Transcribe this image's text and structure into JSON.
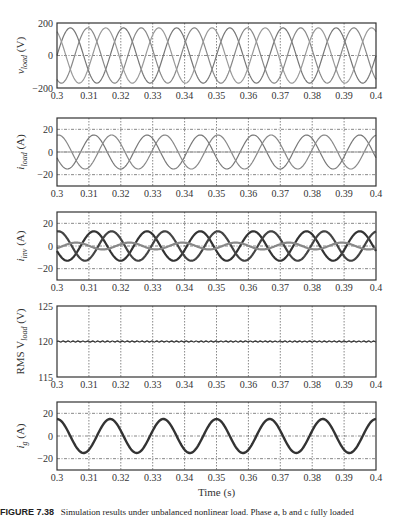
{
  "figure": {
    "xlabel": "Time (s)",
    "caption_label": "FIGURE 7.38",
    "caption_text": "Simulation results under unbalanced nonlinear load. Phase a, b and c fully loaded"
  },
  "chart_data": [
    {
      "type": "line",
      "ylabel": "v_load (V)",
      "ylabel_main": "v",
      "ylabel_sub": "load",
      "ylabel_unit": " (V)",
      "x_range": [
        0.3,
        0.4
      ],
      "ylim": [
        -200,
        200
      ],
      "yticks": [
        -200,
        0,
        200
      ],
      "xticks": [
        "0.3",
        "0.31",
        "0.32",
        "0.33",
        "0.34",
        "0.35",
        "0.36",
        "0.37",
        "0.38",
        "0.39",
        "0.4"
      ],
      "grid": true,
      "series": [
        {
          "name": "phase a",
          "amplitude": 170,
          "freq_hz": 60,
          "phase_deg": 0
        },
        {
          "name": "phase b",
          "amplitude": 170,
          "freq_hz": 60,
          "phase_deg": -120
        },
        {
          "name": "phase c",
          "amplitude": 170,
          "freq_hz": 60,
          "phase_deg": 120
        }
      ]
    },
    {
      "type": "line",
      "ylabel": "i_load (A)",
      "ylabel_main": "i",
      "ylabel_sub": "load",
      "ylabel_unit": " (A)",
      "x_range": [
        0.3,
        0.4
      ],
      "ylim": [
        -30,
        30
      ],
      "yticks": [
        -20,
        0,
        20
      ],
      "xticks": [
        "0.3",
        "0.31",
        "0.32",
        "0.33",
        "0.34",
        "0.35",
        "0.36",
        "0.37",
        "0.38",
        "0.39",
        "0.4"
      ],
      "grid": true,
      "series": [
        {
          "name": "phase a",
          "amplitude": 15,
          "freq_hz": 60,
          "phase_deg": 200
        },
        {
          "name": "phase b",
          "amplitude": 15,
          "freq_hz": 60,
          "phase_deg": 80
        },
        {
          "name": "phase c",
          "amplitude": 0,
          "freq_hz": 60,
          "phase_deg": 0
        }
      ]
    },
    {
      "type": "line",
      "ylabel": "i_inv (A)",
      "ylabel_main": "i",
      "ylabel_sub": "inv",
      "ylabel_unit": " (A)",
      "x_range": [
        0.3,
        0.4
      ],
      "ylim": [
        -30,
        30
      ],
      "yticks": [
        -20,
        0,
        20
      ],
      "xticks": [
        "0.3",
        "0.31",
        "0.32",
        "0.33",
        "0.34",
        "0.35",
        "0.36",
        "0.37",
        "0.38",
        "0.39",
        "0.4"
      ],
      "grid": true,
      "series": [
        {
          "name": "phase a",
          "amplitude": 13,
          "freq_hz": 60,
          "phase_deg": 200
        },
        {
          "name": "phase b",
          "amplitude": 13,
          "freq_hz": 60,
          "phase_deg": 80
        },
        {
          "name": "phase c",
          "amplitude": 3,
          "freq_hz": 60,
          "phase_deg": 320
        }
      ]
    },
    {
      "type": "line",
      "ylabel": "RMS V_load (V)",
      "ylabel_main": "RMS V",
      "ylabel_sub": "load",
      "ylabel_unit": " (V)",
      "x_range": [
        0.3,
        0.4
      ],
      "ylim": [
        115,
        125
      ],
      "yticks": [
        115,
        120,
        125
      ],
      "xticks": [
        "0.3",
        "0.31",
        "0.32",
        "0.33",
        "0.34",
        "0.35",
        "0.36",
        "0.37",
        "0.38",
        "0.39",
        "0.4"
      ],
      "grid": true,
      "series": [
        {
          "name": "RMS",
          "constant": 120
        }
      ]
    },
    {
      "type": "line",
      "ylabel": "i_g (A)",
      "ylabel_main": "i",
      "ylabel_sub": "g",
      "ylabel_unit": " (A)",
      "x_range": [
        0.3,
        0.4
      ],
      "ylim": [
        -30,
        30
      ],
      "yticks": [
        -20,
        0,
        20
      ],
      "xticks": [
        "0.3",
        "0.31",
        "0.32",
        "0.33",
        "0.34",
        "0.35",
        "0.36",
        "0.37",
        "0.38",
        "0.39",
        "0.4"
      ],
      "grid": true,
      "series": [
        {
          "name": "grid current",
          "amplitude": 15,
          "freq_hz": 60,
          "phase_deg": 90
        }
      ]
    }
  ]
}
